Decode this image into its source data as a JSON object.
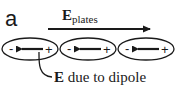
{
  "figure": {
    "panel_label": "a",
    "field_plates": {
      "symbol": "E",
      "subscript": "plates"
    },
    "dipoles": [
      {
        "negative": "-",
        "positive": "+"
      },
      {
        "negative": "-",
        "positive": "+"
      },
      {
        "negative": "-",
        "positive": "+"
      }
    ],
    "dipole_field_label": {
      "symbol": "E",
      "text": " due to dipole"
    },
    "colors": {
      "ink": "#1a1a1a",
      "background": "#ffffff"
    }
  }
}
